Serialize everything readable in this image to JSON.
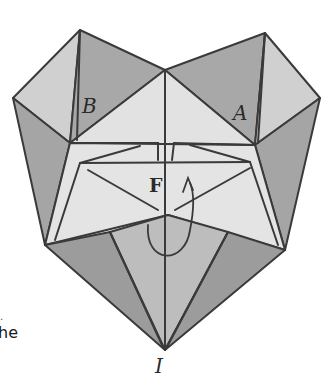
{
  "figure": {
    "labels": {
      "a": "A",
      "b": "B",
      "f": "F",
      "i": "I"
    },
    "side_text": {
      "fragment": "he",
      "mark": "."
    },
    "colors": {
      "background": "#ffffff",
      "dark_face": "#9a9a9a",
      "mid_face": "#b8b8b8",
      "light_face": "#d6d6d6",
      "lightest_face": "#e6e6e6",
      "line": "#3a3a3a"
    }
  }
}
